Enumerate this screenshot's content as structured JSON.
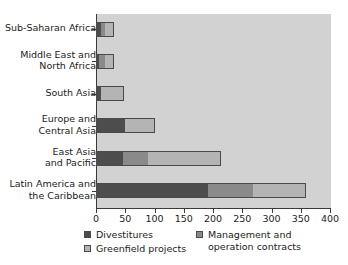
{
  "chart_data": {
    "type": "bar",
    "orientation": "horizontal",
    "stacked": true,
    "title": "",
    "subtitle": "",
    "xlabel": "",
    "ylabel": "",
    "xlim": [
      0,
      400
    ],
    "xticks": [
      0,
      50,
      100,
      150,
      200,
      250,
      300,
      350,
      400
    ],
    "xtick_labels": [
      "0",
      "50",
      "100",
      "150",
      "200",
      "250",
      "300",
      "350",
      "400"
    ],
    "grid": false,
    "legend_position": "bottom",
    "categories": [
      "Sub-Saharan Africa",
      "Middle East and\nNorth Africa",
      "South Asia",
      "Europe and\nCentral Asia",
      "East Asia\nand Pacific",
      "Latin America and\nthe Caribbean"
    ],
    "series": [
      {
        "name": "Divestitures",
        "color": "#4d4d4d",
        "values": [
          9,
          5,
          8,
          50,
          46,
          192
        ]
      },
      {
        "name": "Management and\noperation contracts",
        "color": "#8a8a8a",
        "values": [
          6,
          10,
          0,
          0,
          43,
          77
        ]
      },
      {
        "name": "Greenfield projects",
        "color": "#b4b4b4",
        "values": [
          15,
          15,
          40,
          50,
          125,
          90
        ]
      }
    ],
    "totals": [
      30,
      30,
      48,
      100,
      214,
      359
    ]
  },
  "legend": {
    "columns": [
      {
        "items": [
          {
            "label": "Divestitures",
            "swatch": "#4d4d4d",
            "series_index": 0
          },
          {
            "label": "Greenfield projects",
            "swatch": "#b4b4b4",
            "series_index": 2
          }
        ]
      },
      {
        "items": [
          {
            "label": "Management and\noperation contracts",
            "swatch": "#8a8a8a",
            "series_index": 1
          }
        ]
      }
    ]
  },
  "colors": {
    "plot_background": "#d2d2d2",
    "page_background": "#ffffff",
    "axis": "#3a3a3a",
    "bar_outline": "#4a4a4a",
    "text": "#1c1c1c"
  }
}
